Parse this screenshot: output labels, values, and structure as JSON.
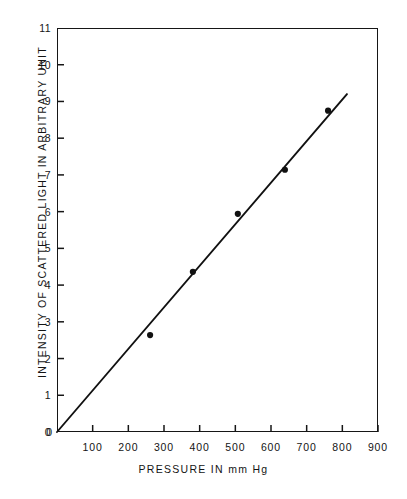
{
  "chart_data": {
    "type": "scatter",
    "title": "",
    "subtitle": "",
    "xlabel": "PRESSURE IN mm Hg",
    "ylabel": "INTENSITY OF SCATTERED LIGHT IN ARBITRARY UNIT",
    "xlim": [
      0,
      900
    ],
    "ylim": [
      0,
      11
    ],
    "grid": false,
    "legend": null,
    "xticks": [
      0,
      100,
      200,
      300,
      400,
      500,
      600,
      700,
      800,
      900
    ],
    "xtick_labels": [
      "0",
      "100",
      "200",
      "300",
      "400",
      "500",
      "600",
      "700",
      "800",
      "900"
    ],
    "yticks": [
      0,
      1,
      2,
      3,
      4,
      5,
      6,
      7,
      8,
      9,
      10,
      11
    ],
    "ytick_labels": [
      "0",
      "1",
      "2",
      "3",
      "4",
      "5",
      "6",
      "7",
      "8",
      "9",
      "10",
      "11"
    ],
    "series": [
      {
        "name": "measured points",
        "marker": "filled-circle",
        "color": "#111111",
        "x": [
          261,
          381,
          507,
          639,
          760
        ],
        "y": [
          2.64,
          4.36,
          5.94,
          7.14,
          8.75
        ]
      },
      {
        "name": "fitted line",
        "marker": "none",
        "style": "solid",
        "color": "#111111",
        "x": [
          0,
          813
        ],
        "y": [
          0,
          9.2
        ]
      }
    ]
  },
  "axis": {
    "x_title": "PRESSURE IN mm Hg",
    "y_title": "INTENSITY OF SCATTERED LIGHT IN ARBITRARY UNIT",
    "origin_label": "0"
  }
}
